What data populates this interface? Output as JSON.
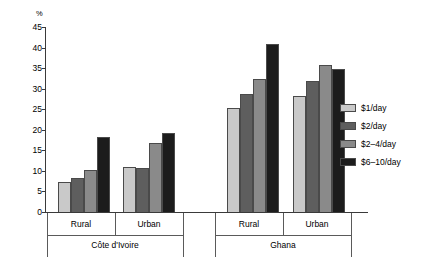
{
  "chart_data": {
    "type": "bar",
    "title": "",
    "subtitle": "",
    "xlabel": "",
    "ylabel": "%",
    "ylim": [
      0,
      45
    ],
    "ytick_step": 5,
    "yticks": [
      "45",
      "40",
      "35",
      "30",
      "25",
      "20",
      "15",
      "10",
      "5",
      "0"
    ],
    "grid": false,
    "legend_position": "right",
    "categories": [
      "Rural",
      "Urban",
      "Rural",
      "Urban"
    ],
    "groups": [
      {
        "region": "Côte d'Ivoire",
        "categories": [
          "Rural",
          "Urban"
        ]
      },
      {
        "region": "Ghana",
        "categories": [
          "Rural",
          "Urban"
        ]
      }
    ],
    "series": [
      {
        "name": "$1/day",
        "color": "#c9c9c9",
        "values": [
          7.5,
          11.2,
          25.5,
          28.5
        ]
      },
      {
        "name": "$2/day",
        "color": "#5e5e5e",
        "values": [
          8.5,
          11.0,
          29.0,
          32.0
        ]
      },
      {
        "name": "$2–4/day",
        "color": "#8a8a8a",
        "values": [
          10.5,
          17.0,
          32.5,
          36.0
        ]
      },
      {
        "name": "$6–10/day",
        "color": "#1c1c1c",
        "values": [
          18.5,
          19.5,
          41.0,
          35.0
        ]
      }
    ],
    "annotations": []
  },
  "legend": {
    "items": [
      {
        "label": "$1/day"
      },
      {
        "label": "$2/day"
      },
      {
        "label": "$2–4/day"
      },
      {
        "label": "$6–10/day"
      }
    ]
  },
  "axis": {
    "unit_label": "%"
  }
}
